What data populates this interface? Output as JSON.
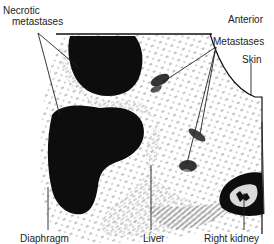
{
  "figure": {
    "type": "labeled ultrasound scan diagram",
    "colors": {
      "background": "#ffffff",
      "ink": "#111111",
      "label_text": "#222222"
    },
    "labels": {
      "necrotic_metastases_line1": "Necrotic",
      "necrotic_metastases_line2": "metastases",
      "anterior": "Anterior",
      "metastases": "Metastases",
      "skin": "Skin",
      "diaphragm": "Diaphragm",
      "liver": "Liver",
      "right_kidney": "Right kidney"
    }
  }
}
